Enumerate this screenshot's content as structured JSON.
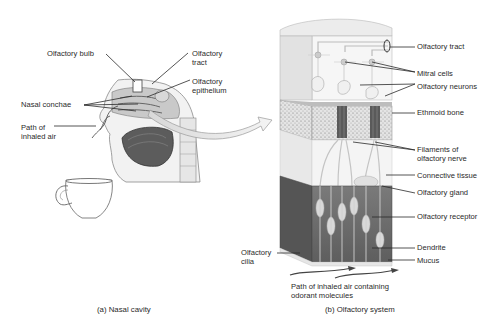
{
  "panel_a": {
    "caption": "(a) Nasal cavity",
    "labels": {
      "olfactory_bulb": "Olfactory bulb",
      "olfactory_tract": "Olfactory\ntract",
      "olfactory_epithelium": "Olfactory\nepithelium",
      "nasal_conchae": "Nasal conchae",
      "path_inhaled_air": "Path of\ninhaled air"
    }
  },
  "panel_b": {
    "caption": "(b) Olfactory system",
    "labels": {
      "olfactory_tract": "Olfactory tract",
      "mitral_cells": "Mitral cells",
      "olfactory_neurons": "Olfactory neurons",
      "ethmoid_bone": "Ethmoid bone",
      "filaments": "Filaments of\nolfactory nerve",
      "connective_tissue": "Connective tissue",
      "olfactory_gland": "Olfactory gland",
      "olfactory_receptor": "Olfactory receptor",
      "dendrite": "Dendrite",
      "mucus": "Mucus",
      "olfactory_cilia": "Olfactory\ncilia",
      "path_air_odorant": "Path of inhaled air containing\nodorant molecules"
    }
  },
  "colors": {
    "line": "#2a2a2a",
    "bone": "#dcdcdc",
    "epithelium_dark": "#6e6e6e",
    "tissue_light": "#eeeeee"
  }
}
